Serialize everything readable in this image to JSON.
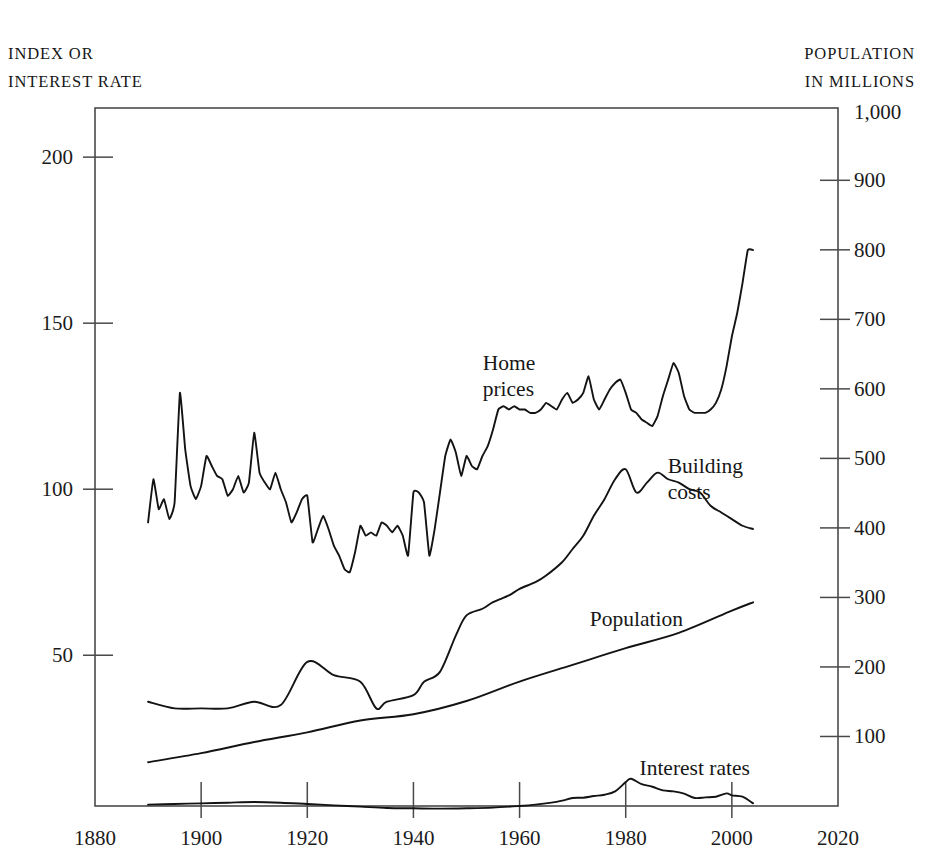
{
  "figure": {
    "left_caption_lines": [
      "INDEX OR",
      "INTEREST RATE"
    ],
    "right_caption_lines": [
      "POPULATION",
      "IN MILLIONS"
    ]
  },
  "chart_data": {
    "type": "line",
    "title": "",
    "subtitle": "",
    "xlabel": "",
    "ylabel": "INDEX OR INTEREST RATE",
    "y2label": "POPULATION IN MILLIONS",
    "grid": false,
    "legend": "inline-annotations",
    "xlim": [
      1880,
      2020
    ],
    "ylim": [
      4.6,
      214.8
    ],
    "y2lim": [
      0,
      1004
    ],
    "xticks": [
      1880,
      1900,
      1920,
      1940,
      1960,
      1980,
      2000,
      2020
    ],
    "xticklabels": [
      "1880",
      "1900",
      "1920",
      "1940",
      "1960",
      "1980",
      "2000",
      "2020"
    ],
    "yticks": [
      50,
      100,
      150,
      200
    ],
    "yticklabels": [
      "50",
      "100",
      "150",
      "200"
    ],
    "y2ticks": [
      100,
      200,
      300,
      400,
      500,
      600,
      700,
      800,
      900,
      1000
    ],
    "y2ticklabels": [
      "100",
      "200",
      "300",
      "400",
      "500",
      "600",
      "700",
      "800",
      "900",
      "1,000"
    ],
    "annotations": [
      {
        "text": "Home\nprices",
        "line1": "Home",
        "line2": "prices",
        "x": 1958,
        "y": 134
      },
      {
        "text": "Building\ncosts",
        "line1": "Building",
        "line2": "costs",
        "x": 1995,
        "y": 103
      },
      {
        "text": "Population",
        "x": 1982,
        "y": 61
      },
      {
        "text": "Interest rates",
        "x": 1993,
        "y": 16
      }
    ],
    "series": [
      {
        "name": "Home prices",
        "axis": "left",
        "x": [
          1890,
          1891,
          1892,
          1893,
          1894,
          1895,
          1896,
          1897,
          1898,
          1899,
          1900,
          1901,
          1902,
          1903,
          1904,
          1905,
          1906,
          1907,
          1908,
          1909,
          1910,
          1911,
          1912,
          1913,
          1914,
          1915,
          1916,
          1917,
          1918,
          1919,
          1920,
          1921,
          1922,
          1923,
          1924,
          1925,
          1926,
          1927,
          1928,
          1929,
          1930,
          1931,
          1932,
          1933,
          1934,
          1935,
          1936,
          1937,
          1938,
          1939,
          1940,
          1941,
          1942,
          1943,
          1944,
          1945,
          1946,
          1947,
          1948,
          1949,
          1950,
          1951,
          1952,
          1953,
          1954,
          1955,
          1956,
          1957,
          1958,
          1959,
          1960,
          1961,
          1962,
          1963,
          1964,
          1965,
          1966,
          1967,
          1968,
          1969,
          1970,
          1971,
          1972,
          1973,
          1974,
          1975,
          1976,
          1977,
          1978,
          1979,
          1980,
          1981,
          1982,
          1983,
          1984,
          1985,
          1986,
          1987,
          1988,
          1989,
          1990,
          1991,
          1992,
          1993,
          1994,
          1995,
          1996,
          1997,
          1998,
          1999,
          2000,
          2001,
          2002,
          2003,
          2004
        ],
        "values": [
          90,
          103,
          94,
          97,
          91,
          96,
          129,
          112,
          101,
          97,
          101,
          110,
          107,
          104,
          103,
          98,
          100,
          104,
          99,
          102,
          117,
          105,
          102,
          100,
          105,
          100,
          96,
          90,
          93,
          97,
          98,
          84,
          88,
          92,
          88,
          83,
          80,
          76,
          75,
          81,
          89,
          86,
          87,
          86,
          90,
          89,
          87,
          89,
          86,
          80,
          99,
          99,
          96,
          80,
          88,
          99,
          110,
          115,
          111,
          104,
          110,
          107,
          106,
          110,
          113,
          118,
          124,
          125,
          124,
          125,
          124,
          124,
          123,
          123,
          124,
          126,
          125,
          124,
          127,
          129,
          126,
          127,
          129,
          134,
          127,
          124,
          127,
          130,
          132,
          133,
          129,
          124,
          123,
          121,
          120,
          119,
          122,
          128,
          133,
          138,
          135,
          128,
          124,
          123,
          123,
          123,
          124,
          126,
          130,
          137,
          146,
          153,
          162,
          172,
          172
        ],
        "units": "index"
      },
      {
        "name": "Building costs",
        "axis": "left",
        "x": [
          1890,
          1895,
          1900,
          1905,
          1910,
          1915,
          1920,
          1925,
          1930,
          1933,
          1935,
          1940,
          1942,
          1945,
          1948,
          1950,
          1953,
          1955,
          1958,
          1960,
          1963,
          1965,
          1968,
          1970,
          1972,
          1974,
          1976,
          1978,
          1980,
          1982,
          1984,
          1986,
          1988,
          1990,
          1992,
          1994,
          1996,
          1998,
          2000,
          2002,
          2004
        ],
        "values": [
          36,
          34,
          34,
          34,
          36,
          35,
          48,
          44,
          42,
          34,
          36,
          38,
          42,
          45,
          56,
          62,
          64,
          66,
          68,
          70,
          72,
          74,
          78,
          82,
          86,
          92,
          97,
          103,
          106,
          99,
          102,
          105,
          103,
          102,
          100,
          99,
          95,
          93,
          91,
          89,
          88
        ],
        "units": "index"
      },
      {
        "name": "Population",
        "axis": "right",
        "x": [
          1890,
          1900,
          1910,
          1920,
          1930,
          1940,
          1950,
          1960,
          1970,
          1980,
          1990,
          2000,
          2004
        ],
        "values": [
          63,
          76,
          92,
          106,
          123,
          132,
          151,
          179,
          203,
          227,
          249,
          281,
          293
        ],
        "units": "millions"
      },
      {
        "name": "Interest rates",
        "axis": "left",
        "x": [
          1890,
          1895,
          1900,
          1905,
          1910,
          1915,
          1920,
          1925,
          1930,
          1935,
          1940,
          1945,
          1950,
          1955,
          1960,
          1963,
          1966,
          1968,
          1970,
          1972,
          1974,
          1976,
          1978,
          1980,
          1981,
          1983,
          1985,
          1987,
          1989,
          1991,
          1993,
          1995,
          1997,
          1999,
          2000,
          2002,
          2004
        ],
        "values": [
          5.0,
          5.2,
          5.4,
          5.6,
          5.8,
          5.6,
          5.2,
          4.8,
          4.4,
          4.0,
          3.9,
          3.8,
          3.9,
          4.1,
          4.6,
          5.0,
          5.6,
          6.2,
          7.0,
          7.1,
          7.6,
          8.0,
          9.0,
          11.8,
          12.8,
          11.2,
          10.4,
          9.3,
          9.0,
          8.3,
          7.0,
          7.2,
          7.4,
          8.4,
          7.8,
          7.4,
          5.4
        ],
        "units": "percent"
      }
    ]
  }
}
